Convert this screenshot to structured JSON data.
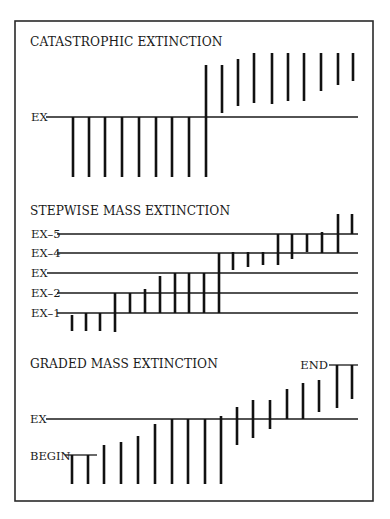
{
  "frame": {
    "x": 15,
    "y": 21,
    "width": 358,
    "height": 480
  },
  "chart_data": [
    {
      "type": "diagram",
      "title": "CATASTROPHIC EXTINCTION",
      "title_pos": {
        "x": 30,
        "y": 46
      },
      "reference_lines": [
        {
          "label": "EX",
          "y": 117,
          "label_x": 31,
          "x1": 46,
          "x2": 358
        }
      ],
      "bars": [
        {
          "x": 73,
          "top": 117,
          "bottom": 177
        },
        {
          "x": 89,
          "top": 117,
          "bottom": 177
        },
        {
          "x": 105,
          "top": 117,
          "bottom": 177
        },
        {
          "x": 122,
          "top": 117,
          "bottom": 177
        },
        {
          "x": 139,
          "top": 117,
          "bottom": 177
        },
        {
          "x": 156,
          "top": 117,
          "bottom": 177
        },
        {
          "x": 172,
          "top": 117,
          "bottom": 177
        },
        {
          "x": 189,
          "top": 117,
          "bottom": 177
        },
        {
          "x": 206,
          "top": 65,
          "bottom": 177
        },
        {
          "x": 222,
          "top": 65,
          "bottom": 113
        },
        {
          "x": 238,
          "top": 59,
          "bottom": 106
        },
        {
          "x": 254,
          "top": 53,
          "bottom": 103
        },
        {
          "x": 272,
          "top": 53,
          "bottom": 104
        },
        {
          "x": 288,
          "top": 53,
          "bottom": 101
        },
        {
          "x": 304,
          "top": 53,
          "bottom": 101
        },
        {
          "x": 321,
          "top": 53,
          "bottom": 91
        },
        {
          "x": 338,
          "top": 53,
          "bottom": 85
        },
        {
          "x": 353,
          "top": 53,
          "bottom": 81
        }
      ]
    },
    {
      "type": "diagram",
      "title": "STEPWISE MASS EXTINCTION",
      "title_pos": {
        "x": 30,
        "y": 215
      },
      "reference_lines": [
        {
          "label": "EX–5",
          "y": 234,
          "label_x": 31,
          "x1": 57,
          "x2": 358
        },
        {
          "label": "EX–4",
          "y": 253,
          "label_x": 31,
          "x1": 57,
          "x2": 358
        },
        {
          "label": "EX",
          "y": 273,
          "label_x": 31,
          "x1": 47,
          "x2": 358
        },
        {
          "label": "EX–2",
          "y": 293,
          "label_x": 31,
          "x1": 57,
          "x2": 358
        },
        {
          "label": "EX–1",
          "y": 313,
          "label_x": 31,
          "x1": 57,
          "x2": 358
        }
      ],
      "bars": [
        {
          "x": 72,
          "top": 315,
          "bottom": 331
        },
        {
          "x": 86,
          "top": 313,
          "bottom": 331
        },
        {
          "x": 100,
          "top": 313,
          "bottom": 331
        },
        {
          "x": 115,
          "top": 293,
          "bottom": 332
        },
        {
          "x": 130,
          "top": 293,
          "bottom": 313
        },
        {
          "x": 145,
          "top": 289,
          "bottom": 313
        },
        {
          "x": 160,
          "top": 276,
          "bottom": 313
        },
        {
          "x": 175,
          "top": 273,
          "bottom": 313
        },
        {
          "x": 189,
          "top": 273,
          "bottom": 313
        },
        {
          "x": 204,
          "top": 273,
          "bottom": 313
        },
        {
          "x": 219,
          "top": 253,
          "bottom": 313
        },
        {
          "x": 233,
          "top": 252,
          "bottom": 270
        },
        {
          "x": 248,
          "top": 252,
          "bottom": 267
        },
        {
          "x": 263,
          "top": 252,
          "bottom": 265
        },
        {
          "x": 278,
          "top": 234,
          "bottom": 265
        },
        {
          "x": 292,
          "top": 234,
          "bottom": 259
        },
        {
          "x": 307,
          "top": 234,
          "bottom": 252
        },
        {
          "x": 322,
          "top": 232,
          "bottom": 253
        },
        {
          "x": 338,
          "top": 214,
          "bottom": 253
        },
        {
          "x": 352,
          "top": 214,
          "bottom": 234
        }
      ]
    },
    {
      "type": "diagram",
      "title": "GRADED MASS EXTINCTION",
      "title_pos": {
        "x": 30,
        "y": 368
      },
      "reference_lines": [
        {
          "label": "EX",
          "y": 419,
          "label_x": 30,
          "x1": 46,
          "x2": 358
        }
      ],
      "end_markers": [
        {
          "label": "BEGIN",
          "y": 455,
          "label_x": 30,
          "label_y": 460,
          "x1": 65,
          "x2": 97,
          "anchor": "start"
        },
        {
          "label": "END",
          "y": 365,
          "label_x": 328,
          "label_y": 369,
          "x1": 329,
          "x2": 358,
          "anchor": "end"
        }
      ],
      "bars": [
        {
          "x": 72,
          "top": 455,
          "bottom": 484
        },
        {
          "x": 88,
          "top": 455,
          "bottom": 484
        },
        {
          "x": 104,
          "top": 445,
          "bottom": 484
        },
        {
          "x": 121,
          "top": 442,
          "bottom": 484
        },
        {
          "x": 138,
          "top": 436,
          "bottom": 484
        },
        {
          "x": 155,
          "top": 424,
          "bottom": 484
        },
        {
          "x": 172,
          "top": 419,
          "bottom": 484
        },
        {
          "x": 188,
          "top": 419,
          "bottom": 484
        },
        {
          "x": 205,
          "top": 419,
          "bottom": 484
        },
        {
          "x": 221,
          "top": 416,
          "bottom": 484
        },
        {
          "x": 237,
          "top": 407,
          "bottom": 445
        },
        {
          "x": 253,
          "top": 400,
          "bottom": 438
        },
        {
          "x": 270,
          "top": 400,
          "bottom": 429
        },
        {
          "x": 287,
          "top": 389,
          "bottom": 419
        },
        {
          "x": 303,
          "top": 383,
          "bottom": 419
        },
        {
          "x": 319,
          "top": 380,
          "bottom": 412
        },
        {
          "x": 337,
          "top": 365,
          "bottom": 408
        },
        {
          "x": 352,
          "top": 365,
          "bottom": 399
        }
      ]
    }
  ]
}
